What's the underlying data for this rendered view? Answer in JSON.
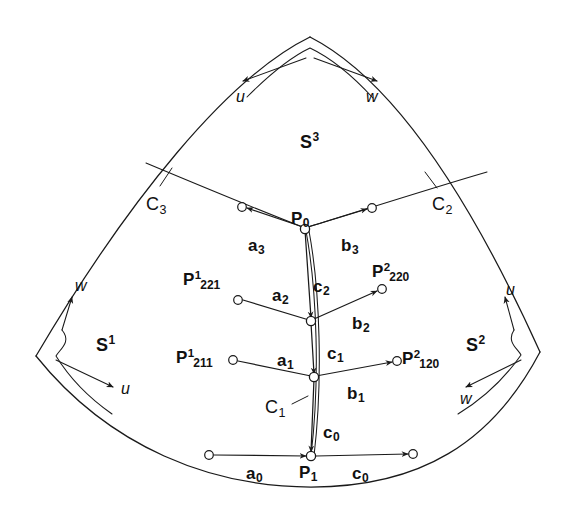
{
  "figure": {
    "background": "#ffffff",
    "ink": "#1a1a1a",
    "width": 580,
    "height": 509
  },
  "patches": [
    {
      "name": "S1",
      "base": "S",
      "sup": "1",
      "x": 96,
      "y": 334
    },
    {
      "name": "S2",
      "base": "S",
      "sup": "2",
      "x": 466,
      "y": 334
    },
    {
      "name": "S3",
      "base": "S",
      "sup": "3",
      "x": 300,
      "y": 131
    }
  ],
  "curves": [
    {
      "name": "C1",
      "base": "C",
      "sub": "1",
      "x": 265,
      "y": 398
    },
    {
      "name": "C2",
      "base": "C",
      "sub": "2",
      "x": 432,
      "y": 195
    },
    {
      "name": "C3",
      "base": "C",
      "sub": "3",
      "x": 146,
      "y": 195
    }
  ],
  "points": [
    {
      "name": "P0",
      "base": "P",
      "sub": "0",
      "x": 291,
      "y": 210
    },
    {
      "name": "P1",
      "base": "P",
      "sub": "1",
      "x": 299,
      "y": 464
    }
  ],
  "indexed_points": [
    {
      "name": "P1_221",
      "base": "P",
      "sup": "1",
      "sub": "221",
      "x": 183,
      "y": 270
    },
    {
      "name": "P1_211",
      "base": "P",
      "sup": "1",
      "sub": "211",
      "x": 176,
      "y": 348
    },
    {
      "name": "P2_220",
      "base": "P",
      "sup": "2",
      "sub": "220",
      "x": 372,
      "y": 262
    },
    {
      "name": "P2_120",
      "base": "P",
      "sup": "2",
      "sub": "120",
      "x": 402,
      "y": 349
    }
  ],
  "vectors": [
    {
      "name": "a0",
      "base": "a",
      "sub": "0",
      "x": 246,
      "y": 465
    },
    {
      "name": "a1",
      "base": "a",
      "sub": "1",
      "x": 277,
      "y": 352
    },
    {
      "name": "a2",
      "base": "a",
      "sub": "2",
      "x": 272,
      "y": 287
    },
    {
      "name": "a3",
      "base": "a",
      "sub": "3",
      "x": 248,
      "y": 237
    },
    {
      "name": "b1",
      "base": "b",
      "sub": "1",
      "x": 347,
      "y": 385
    },
    {
      "name": "b2",
      "base": "b",
      "sub": "2",
      "x": 352,
      "y": 315
    },
    {
      "name": "b3",
      "base": "b",
      "sub": "3",
      "x": 341,
      "y": 237
    },
    {
      "name": "c0_vertical",
      "base": "c",
      "sub": "0",
      "x": 323,
      "y": 424
    },
    {
      "name": "c0_baseline",
      "base": "c",
      "sub": "0",
      "x": 352,
      "y": 465
    },
    {
      "name": "c1",
      "base": "c",
      "sub": "1",
      "x": 327,
      "y": 345
    },
    {
      "name": "c2",
      "base": "c",
      "sub": "2",
      "x": 313,
      "y": 278
    }
  ],
  "params": [
    {
      "name": "u-top",
      "label": "u",
      "x": 236,
      "y": 89
    },
    {
      "name": "w-top",
      "label": "w",
      "x": 366,
      "y": 89
    },
    {
      "name": "w-left",
      "label": "w",
      "x": 75,
      "y": 278
    },
    {
      "name": "u-left",
      "label": "u",
      "x": 121,
      "y": 381
    },
    {
      "name": "u-right",
      "label": "u",
      "x": 506,
      "y": 282
    },
    {
      "name": "w-right",
      "label": "w",
      "x": 460,
      "y": 391
    }
  ]
}
